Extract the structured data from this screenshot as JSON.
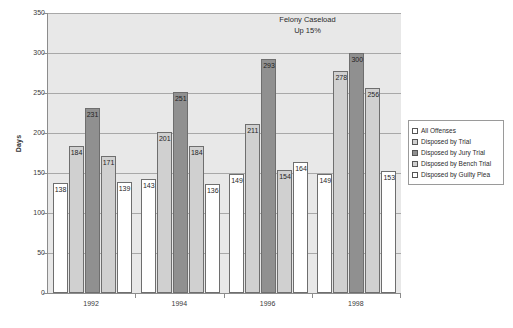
{
  "chart_data": {
    "type": "bar",
    "title": "",
    "annotation": [
      "Felony Caseload",
      "Up 15%"
    ],
    "xlabel": "",
    "ylabel": "Days",
    "ylim": [
      0,
      350
    ],
    "ytick_step": 50,
    "yticks": [
      0,
      50,
      100,
      150,
      200,
      250,
      300,
      350
    ],
    "grid": true,
    "legend_position": "right",
    "categories": [
      "1992",
      "1994",
      "1996",
      "1998"
    ],
    "series": [
      {
        "name": "All Offenses",
        "style": "white",
        "values": [
          138,
          143,
          149,
          149
        ]
      },
      {
        "name": "Disposed by Trial",
        "style": "light",
        "values": [
          184,
          201,
          211,
          278
        ]
      },
      {
        "name": "Disposed by Jury Trial",
        "style": "dark",
        "values": [
          231,
          251,
          293,
          300
        ]
      },
      {
        "name": "Disposed by Bench Trial",
        "style": "light",
        "values": [
          171,
          184,
          154,
          256
        ]
      },
      {
        "name": "Disposed by Guilty Plea",
        "style": "white",
        "values": [
          139,
          136,
          164,
          153
        ]
      }
    ]
  }
}
